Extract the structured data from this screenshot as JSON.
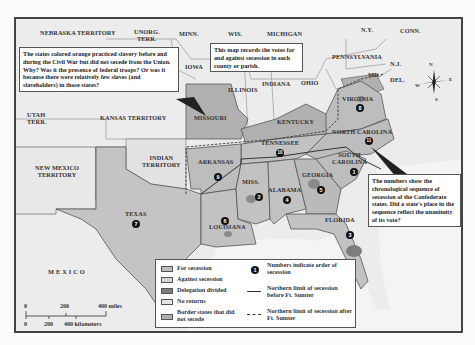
{
  "map": {
    "title_hidden": "",
    "colors": {
      "for_secession": "#bdbdbd",
      "against_secession": "#d2d2d2",
      "delegation_divided": "#7d7d7d",
      "no_returns": "#e4e4e4",
      "border_states": "#b0b0b0",
      "background": "#ececec"
    },
    "region_labels": {
      "nebraska": "NEBRASKA TERRITORY",
      "unorg": "UNORG.\nTERR.",
      "minn": "MINN.",
      "wis": "WIS.",
      "michigan": "MICHIGAN",
      "ny": "N.Y.",
      "conn": "CONN.",
      "iowa": "IOWA",
      "pennsylvania": "PENNSYLVANIA",
      "nj": "N.J.",
      "md": "MD.",
      "del": "DEL.",
      "illinois": "ILLINOIS",
      "indiana": "INDIANA",
      "ohio": "OHIO",
      "virginia": "VIRGINIA",
      "utah": "UTAH\nTERR.",
      "kansas": "KANSAS TERRITORY",
      "missouri": "MISSOURI",
      "kentucky": "KENTUCKY",
      "north_carolina": "NORTH CAROLINA",
      "tennessee": "TENNESSEE",
      "new_mexico": "NEW MEXICO\nTERRITORY",
      "indian_territory": "INDIAN\nTERRITORY",
      "arkansas": "ARKANSAS",
      "south_carolina": "SOUTH\nCAROLINA",
      "georgia": "GEORGIA",
      "miss": "MISS.",
      "alabama": "ALABAMA",
      "texas": "TEXAS",
      "louisiana": "LOUISIANA",
      "florida": "FLORIDA",
      "mexico": "MEXICO"
    },
    "secession_order": {
      "south_carolina": "1",
      "mississippi": "2",
      "florida": "3",
      "alabama": "4",
      "georgia": "5",
      "louisiana": "6",
      "texas": "7",
      "virginia": "8",
      "arkansas": "9",
      "tennessee": "10",
      "north_carolina": "11"
    },
    "compass": {
      "n": "N",
      "e": "E",
      "s": "S",
      "w": "W"
    }
  },
  "callouts": {
    "border_states_note": "The states colored orange practiced slavery before and during the Civil War but did not secede from the Union. Why? Was it the presence of federal troops? Or was it because there were relatively few slaves (and slaveholders) in those states?",
    "votes_note": "This map records the votes for and against secession in each county or parish.",
    "sequence_note": "The numbers show the chronological sequence of secession of the Confederate states. Did a state's place in the sequence reflect the unanimity of its vote?"
  },
  "legend": {
    "items": [
      {
        "label": "For secession"
      },
      {
        "label": "Against secession"
      },
      {
        "label": "Delegation divided"
      },
      {
        "label": "No returns"
      },
      {
        "label": "Border states that did not secede"
      }
    ],
    "symbols": [
      {
        "symbol": "1",
        "label": "Numbers indicate order of secession"
      },
      {
        "symbol": "solid-line",
        "label": "Northern limit of secession before Ft. Sumter"
      },
      {
        "symbol": "dashed-line",
        "label": "Northern limit of secession after Ft. Sumter"
      }
    ]
  },
  "scale": {
    "miles_ticks": [
      "0",
      "200",
      "400 miles"
    ],
    "km_ticks": [
      "0",
      "200",
      "400 kilometers"
    ]
  }
}
